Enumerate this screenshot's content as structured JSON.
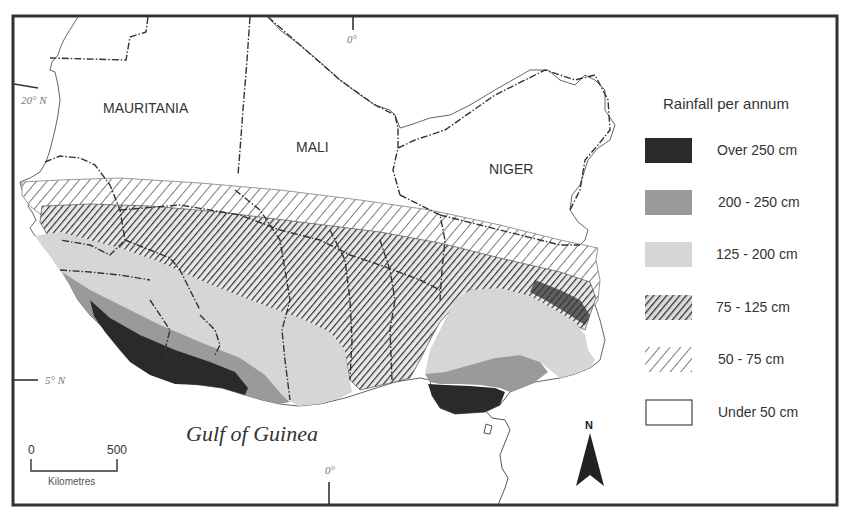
{
  "map": {
    "countries": [
      {
        "id": "mauritania",
        "label": "MAURITANIA"
      },
      {
        "id": "mali",
        "label": "MALI"
      },
      {
        "id": "niger",
        "label": "NIGER"
      }
    ],
    "water_label": "Gulf of Guinea",
    "coordinates": {
      "lat_20": "20° N",
      "lat_5": "5° N",
      "lon_0_top": "0°",
      "lon_0_bottom": "0°"
    },
    "scale_bar": {
      "start": "0",
      "end": "500",
      "unit": "Kilometres"
    },
    "north_arrow": {
      "label": "N"
    }
  },
  "legend": {
    "title": "Rainfall per annum",
    "items": [
      {
        "id": "over-250",
        "label": "Over 250 cm",
        "fill": "#2a2a2a",
        "pattern": "solid"
      },
      {
        "id": "200-250",
        "label": "200 - 250 cm",
        "fill": "#9a9a9a",
        "pattern": "solid"
      },
      {
        "id": "125-200",
        "label": "125 - 200 cm",
        "fill": "#d6d6d6",
        "pattern": "solid"
      },
      {
        "id": "75-125",
        "label": "75 - 125 cm",
        "fill": "#555555",
        "pattern": "dense-hatch"
      },
      {
        "id": "50-75",
        "label": "50 - 75 cm",
        "fill": "#777777",
        "pattern": "sparse-hatch"
      },
      {
        "id": "under-50",
        "label": "Under 50 cm",
        "fill": "#ffffff",
        "pattern": "none"
      }
    ]
  },
  "colors": {
    "frame": "#333333",
    "border_line": "#333333",
    "text": "#333333"
  }
}
